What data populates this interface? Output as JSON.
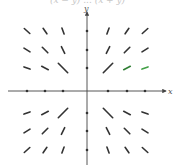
{
  "caption": "(x − y) ... (x + y)",
  "chart_data": {
    "type": "vector_field",
    "title": "",
    "xlabel": "x",
    "ylabel": "y",
    "origin_px": [
      87,
      91
    ],
    "grid_spacing_px": 27,
    "xlim": [
      -3,
      3
    ],
    "ylim": [
      -3,
      3
    ],
    "grid_x": [
      -3,
      -2,
      -1,
      1,
      2,
      3
    ],
    "grid_y": [
      -3,
      -2,
      -1,
      1,
      2,
      3
    ],
    "vectors": [
      {
        "x": -3,
        "y": 3,
        "dx": -0.5,
        "dy": 0.45,
        "color": "#333333"
      },
      {
        "x": -2,
        "y": 3,
        "dx": -0.35,
        "dy": 0.5,
        "color": "#333333"
      },
      {
        "x": -1,
        "y": 3,
        "dx": -0.2,
        "dy": 0.55,
        "color": "#333333"
      },
      {
        "x": 1,
        "y": 3,
        "dx": 0.2,
        "dy": 0.55,
        "color": "#333333"
      },
      {
        "x": 2,
        "y": 3,
        "dx": 0.35,
        "dy": 0.5,
        "color": "#333333"
      },
      {
        "x": 3,
        "y": 3,
        "dx": 0.5,
        "dy": 0.45,
        "color": "#333333"
      },
      {
        "x": -3,
        "y": 2,
        "dx": -0.55,
        "dy": 0.35,
        "color": "#333333"
      },
      {
        "x": -2,
        "y": 2,
        "dx": -0.5,
        "dy": 0.5,
        "color": "#333333"
      },
      {
        "x": -1,
        "y": 2,
        "dx": -0.3,
        "dy": 0.6,
        "color": "#333333"
      },
      {
        "x": 1,
        "y": 2,
        "dx": 0.3,
        "dy": 0.6,
        "color": "#333333"
      },
      {
        "x": 2,
        "y": 2,
        "dx": 0.5,
        "dy": 0.5,
        "color": "#333333"
      },
      {
        "x": 3,
        "y": 2,
        "dx": 0.55,
        "dy": 0.35,
        "color": "#333333"
      },
      {
        "x": -3,
        "y": 1,
        "dx": -0.55,
        "dy": 0.2,
        "color": "#333333"
      },
      {
        "x": -2,
        "y": 1,
        "dx": -0.6,
        "dy": 0.3,
        "color": "#333333"
      },
      {
        "x": -1,
        "y": 1,
        "dx": -0.85,
        "dy": 0.85,
        "color": "#333333"
      },
      {
        "x": 1,
        "y": 1,
        "dx": 0.85,
        "dy": 0.85,
        "color": "#333333"
      },
      {
        "x": 2,
        "y": 1,
        "dx": 0.6,
        "dy": 0.3,
        "color": "#2e7d32"
      },
      {
        "x": 3,
        "y": 1,
        "dx": 0.55,
        "dy": 0.2,
        "color": "#43a047"
      },
      {
        "x": -3,
        "y": -1,
        "dx": -0.55,
        "dy": -0.2,
        "color": "#333333"
      },
      {
        "x": -2,
        "y": -1,
        "dx": -0.6,
        "dy": -0.3,
        "color": "#333333"
      },
      {
        "x": -1,
        "y": -1,
        "dx": -0.85,
        "dy": -0.85,
        "color": "#333333"
      },
      {
        "x": 1,
        "y": -1,
        "dx": 0.85,
        "dy": -0.85,
        "color": "#333333"
      },
      {
        "x": 2,
        "y": -1,
        "dx": 0.6,
        "dy": -0.3,
        "color": "#333333"
      },
      {
        "x": 3,
        "y": -1,
        "dx": 0.55,
        "dy": -0.2,
        "color": "#333333"
      },
      {
        "x": -3,
        "y": -2,
        "dx": -0.55,
        "dy": -0.35,
        "color": "#333333"
      },
      {
        "x": -2,
        "y": -2,
        "dx": -0.5,
        "dy": -0.5,
        "color": "#333333"
      },
      {
        "x": -1,
        "y": -2,
        "dx": -0.3,
        "dy": -0.6,
        "color": "#333333"
      },
      {
        "x": 1,
        "y": -2,
        "dx": 0.3,
        "dy": -0.6,
        "color": "#333333"
      },
      {
        "x": 2,
        "y": -2,
        "dx": 0.5,
        "dy": -0.5,
        "color": "#333333"
      },
      {
        "x": 3,
        "y": -2,
        "dx": 0.55,
        "dy": -0.35,
        "color": "#333333"
      },
      {
        "x": -3,
        "y": -3,
        "dx": -0.5,
        "dy": -0.45,
        "color": "#333333"
      },
      {
        "x": -2,
        "y": -3,
        "dx": -0.35,
        "dy": -0.5,
        "color": "#333333"
      },
      {
        "x": -1,
        "y": -3,
        "dx": -0.2,
        "dy": -0.55,
        "color": "#333333"
      },
      {
        "x": 1,
        "y": -3,
        "dx": 0.2,
        "dy": -0.55,
        "color": "#333333"
      },
      {
        "x": 2,
        "y": -3,
        "dx": 0.35,
        "dy": -0.5,
        "color": "#333333"
      },
      {
        "x": 3,
        "y": -3,
        "dx": 0.5,
        "dy": -0.45,
        "color": "#333333"
      }
    ],
    "axis_vectors": [
      {
        "x": -3,
        "y": 0,
        "dx": -0.5,
        "dy": 0
      },
      {
        "x": -2,
        "y": 0,
        "dx": -0.5,
        "dy": 0
      },
      {
        "x": -1,
        "y": 0,
        "dx": -0.5,
        "dy": 0
      },
      {
        "x": 1,
        "y": 0,
        "dx": 0.5,
        "dy": 0
      },
      {
        "x": 2,
        "y": 0,
        "dx": 0.5,
        "dy": 0
      },
      {
        "x": 3,
        "y": 0,
        "dx": 0.5,
        "dy": 0
      },
      {
        "x": 0,
        "y": 1,
        "dx": 0,
        "dy": 0.5
      },
      {
        "x": 0,
        "y": 2,
        "dx": 0,
        "dy": 0.5
      },
      {
        "x": 0,
        "y": 3,
        "dx": 0,
        "dy": 0.5
      },
      {
        "x": 0,
        "y": -1,
        "dx": 0,
        "dy": -0.5
      },
      {
        "x": 0,
        "y": -2,
        "dx": 0,
        "dy": -0.5
      },
      {
        "x": 0,
        "y": -3,
        "dx": 0,
        "dy": -0.5
      }
    ],
    "colors": {
      "axis": "#444444",
      "arrow": "#333333",
      "accent_green": "#43a047"
    }
  }
}
